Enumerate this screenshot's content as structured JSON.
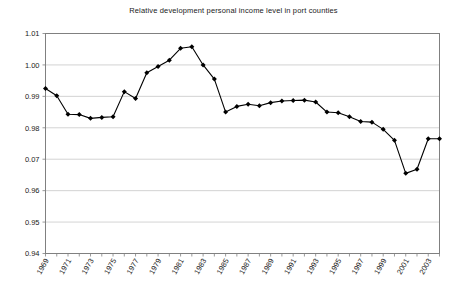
{
  "chart_data": {
    "type": "line",
    "title": "Relative development personal income level in port counties",
    "xlabel": "",
    "ylabel": "",
    "ylim": [
      0.94,
      1.01
    ],
    "xlim": [
      1969,
      2004
    ],
    "grid": true,
    "legend": false,
    "marker": "filled-diamond",
    "line_color": "#000000",
    "grid_color": "#c8c8c8",
    "axis_color": "#808080",
    "ytick_labels": [
      "1.01",
      "1.00",
      "0.99",
      "0.98",
      "0.07",
      "0.96",
      "0.95",
      "0.94"
    ],
    "ytick_values": [
      1.01,
      1.0,
      0.99,
      0.98,
      0.97,
      0.96,
      0.95,
      0.94
    ],
    "xtick_labels": [
      "1969",
      "1971",
      "1973",
      "1975",
      "1977",
      "1979",
      "1981",
      "1983",
      "1985",
      "1987",
      "1989",
      "1991",
      "1993",
      "1995",
      "1997",
      "1999",
      "2001",
      "2003"
    ],
    "x": [
      1969,
      1970,
      1971,
      1972,
      1973,
      1974,
      1975,
      1976,
      1977,
      1978,
      1979,
      1980,
      1981,
      1982,
      1983,
      1984,
      1985,
      1986,
      1987,
      1988,
      1989,
      1990,
      1991,
      1992,
      1993,
      1994,
      1995,
      1996,
      1997,
      1998,
      1999,
      2000,
      2001,
      2002,
      2003,
      2004
    ],
    "values": [
      0.9925,
      0.9902,
      0.9843,
      0.9842,
      0.983,
      0.9833,
      0.9835,
      0.9915,
      0.9893,
      0.9975,
      0.9995,
      1.0015,
      1.0053,
      1.0058,
      1.0,
      0.9955,
      0.985,
      0.9868,
      0.9875,
      0.987,
      0.988,
      0.9885,
      0.9887,
      0.9888,
      0.9882,
      0.985,
      0.9848,
      0.9835,
      0.982,
      0.9818,
      0.9795,
      0.976,
      0.9655,
      0.9668,
      0.9765,
      0.9765
    ],
    "series_name": "Relative personal income level"
  }
}
